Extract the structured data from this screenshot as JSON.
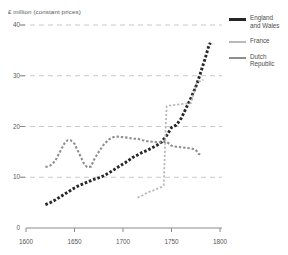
{
  "chart_data": {
    "type": "line",
    "title": "",
    "subtitle": "",
    "ylabel": "£ million (constant prices)",
    "xlabel": "",
    "xlim": [
      1600,
      1800
    ],
    "ylim": [
      0,
      40
    ],
    "yticks": [
      0,
      10,
      20,
      30,
      40
    ],
    "xticks": [
      1600,
      1650,
      1700,
      1750,
      1800
    ],
    "grid": "horizontal-dashed",
    "legend_position": "right",
    "series": [
      {
        "name": "England and Wales",
        "color": "#262626",
        "style": "dotted-thick",
        "points": [
          [
            1620,
            4.6
          ],
          [
            1625,
            5.0
          ],
          [
            1630,
            5.5
          ],
          [
            1635,
            6.1
          ],
          [
            1640,
            6.7
          ],
          [
            1645,
            7.3
          ],
          [
            1650,
            7.9
          ],
          [
            1655,
            8.4
          ],
          [
            1660,
            8.8
          ],
          [
            1665,
            9.2
          ],
          [
            1670,
            9.6
          ],
          [
            1675,
            9.9
          ],
          [
            1680,
            10.3
          ],
          [
            1685,
            10.8
          ],
          [
            1690,
            11.4
          ],
          [
            1695,
            12.0
          ],
          [
            1700,
            12.6
          ],
          [
            1705,
            13.2
          ],
          [
            1710,
            13.9
          ],
          [
            1715,
            14.4
          ],
          [
            1720,
            14.9
          ],
          [
            1725,
            15.3
          ],
          [
            1730,
            15.8
          ],
          [
            1735,
            16.3
          ],
          [
            1740,
            17.0
          ],
          [
            1745,
            18.2
          ],
          [
            1750,
            19.8
          ],
          [
            1755,
            20.3
          ],
          [
            1760,
            21.6
          ],
          [
            1765,
            23.6
          ],
          [
            1770,
            25.6
          ],
          [
            1775,
            27.8
          ],
          [
            1778,
            29.4
          ],
          [
            1780,
            30.6
          ],
          [
            1785,
            33.6
          ],
          [
            1788,
            35.6
          ],
          [
            1790,
            36.5
          ]
        ]
      },
      {
        "name": "France",
        "color": "#b9b9b9",
        "style": "dotted-thin",
        "points": [
          [
            1715,
            6.0
          ],
          [
            1720,
            6.4
          ],
          [
            1725,
            7.0
          ],
          [
            1730,
            7.3
          ],
          [
            1735,
            7.7
          ],
          [
            1740,
            8.1
          ],
          [
            1742,
            8.4
          ],
          [
            1743,
            14.0
          ],
          [
            1744,
            20.0
          ],
          [
            1745,
            24.0
          ],
          [
            1750,
            24.2
          ],
          [
            1755,
            24.3
          ],
          [
            1760,
            24.4
          ],
          [
            1765,
            24.5
          ],
          [
            1770,
            24.6
          ],
          [
            1773,
            26.5
          ],
          [
            1776,
            28.5
          ],
          [
            1780,
            29.0
          ],
          [
            1783,
            29.2
          ]
        ]
      },
      {
        "name": "Dutch Republic",
        "color": "#8e8e8e",
        "style": "dotted-medium",
        "points": [
          [
            1620,
            12.0
          ],
          [
            1625,
            12.3
          ],
          [
            1630,
            13.2
          ],
          [
            1635,
            15.0
          ],
          [
            1640,
            16.8
          ],
          [
            1643,
            17.3
          ],
          [
            1646,
            17.3
          ],
          [
            1650,
            16.6
          ],
          [
            1655,
            14.6
          ],
          [
            1660,
            12.6
          ],
          [
            1663,
            12.0
          ],
          [
            1667,
            12.1
          ],
          [
            1670,
            13.4
          ],
          [
            1675,
            15.0
          ],
          [
            1680,
            16.4
          ],
          [
            1685,
            17.4
          ],
          [
            1690,
            17.9
          ],
          [
            1695,
            18.0
          ],
          [
            1700,
            17.9
          ],
          [
            1705,
            17.8
          ],
          [
            1710,
            17.6
          ],
          [
            1715,
            17.6
          ],
          [
            1720,
            17.3
          ],
          [
            1725,
            17.1
          ],
          [
            1730,
            17.0
          ],
          [
            1735,
            16.9
          ],
          [
            1740,
            16.9
          ],
          [
            1745,
            17.0
          ],
          [
            1750,
            16.2
          ],
          [
            1755,
            16.0
          ],
          [
            1760,
            15.9
          ],
          [
            1765,
            15.8
          ],
          [
            1770,
            15.7
          ],
          [
            1775,
            15.4
          ],
          [
            1778,
            14.6
          ],
          [
            1780,
            14.5
          ]
        ]
      }
    ]
  },
  "legend": {
    "items": [
      {
        "label_line1": "England",
        "label_line2": "and Wales",
        "swatch": "sw-eng"
      },
      {
        "label_line1": "France",
        "label_line2": "",
        "swatch": "sw-fra"
      },
      {
        "label_line1": "Dutch",
        "label_line2": "Republic",
        "swatch": "sw-dut"
      }
    ]
  },
  "axes": {
    "y_title": "£ million (constant prices)",
    "y_tick_labels": [
      "40",
      "30",
      "20",
      "10",
      "0"
    ],
    "x_tick_labels": [
      "1600",
      "1650",
      "1700",
      "1750",
      "1800"
    ]
  },
  "colors": {
    "england": "#262626",
    "france": "#b9b9b9",
    "dutch": "#8e8e8e",
    "grid": "#c9c9c9",
    "axis": "#8a8a8a",
    "text": "#585858"
  }
}
